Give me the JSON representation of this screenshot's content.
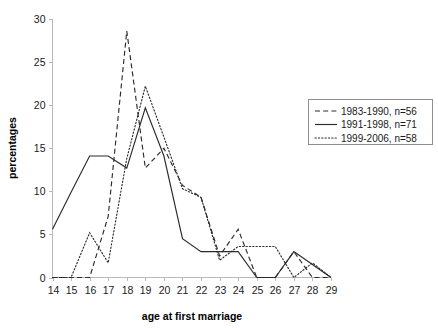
{
  "chart_data": {
    "type": "line",
    "title": "",
    "xlabel": "age at first marriage",
    "ylabel": "percentages",
    "x": [
      14,
      15,
      16,
      17,
      18,
      19,
      20,
      21,
      22,
      23,
      24,
      25,
      26,
      27,
      28,
      29
    ],
    "xlim": [
      14,
      29
    ],
    "ylim": [
      0,
      30
    ],
    "yticks": [
      0,
      5,
      10,
      15,
      20,
      25,
      30
    ],
    "xticks": [
      14,
      15,
      16,
      17,
      18,
      19,
      20,
      21,
      22,
      23,
      24,
      25,
      26,
      27,
      28,
      29
    ],
    "grid": false,
    "legend_position": "right",
    "series": [
      {
        "name": "1983-1990, n=56",
        "style": "dashed",
        "color": "#2b2b2b",
        "values": [
          0,
          0,
          0,
          7.1,
          28.6,
          12.7,
          15.0,
          10.7,
          9.3,
          2.5,
          5.6,
          0,
          0,
          3.0,
          0,
          0
        ]
      },
      {
        "name": "1991-1998, n=71",
        "style": "solid",
        "color": "#2b2b2b",
        "values": [
          5.6,
          9.9,
          14.1,
          14.1,
          12.7,
          19.7,
          14.1,
          4.5,
          3.0,
          3.0,
          3.0,
          0,
          0,
          3.0,
          1.5,
          0
        ]
      },
      {
        "name": "1999-2006, n=58",
        "style": "dotted",
        "color": "#2b2b2b",
        "values": [
          0,
          0,
          5.2,
          1.7,
          13.8,
          22.2,
          16.3,
          10.3,
          9.3,
          2.0,
          3.6,
          3.6,
          3.6,
          0,
          1.7,
          0
        ]
      }
    ]
  },
  "legend": {
    "entries": [
      {
        "label": "1983-1990, n=56"
      },
      {
        "label": "1991-1998, n=71"
      },
      {
        "label": "1999-2006, n=58"
      }
    ]
  },
  "axes": {
    "y_title": "percentages",
    "x_title": "age at first marriage",
    "y_tick_labels": [
      "0",
      "5",
      "10",
      "15",
      "20",
      "25",
      "30"
    ],
    "x_tick_labels": [
      "14",
      "15",
      "16",
      "17",
      "18",
      "19",
      "20",
      "21",
      "22",
      "23",
      "24",
      "25",
      "26",
      "27",
      "28",
      "29"
    ]
  }
}
